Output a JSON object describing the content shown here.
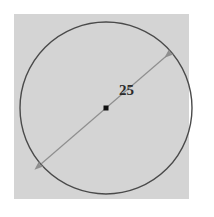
{
  "figure": {
    "kind": "geometry-diagram",
    "panel": {
      "background_color": "#d4d4d4",
      "x": 14,
      "y": 14,
      "width": 175,
      "height": 185
    },
    "circle": {
      "center_x": 106,
      "center_y": 108,
      "radius": 86,
      "stroke_color": "#4a4a4a",
      "fill_color": "none"
    },
    "center_point": {
      "name": "center-marker",
      "x": 106,
      "y": 108,
      "size": 5,
      "color": "#111111"
    },
    "diameter_arrow": {
      "name": "diameter-double-arrow",
      "x1": 41,
      "y1": 164,
      "x2": 171,
      "y2": 52,
      "stroke_color": "#8f8f8f",
      "arrowheads": "both"
    },
    "measurement_label": {
      "text": "25",
      "x": 119,
      "y": 83,
      "color": "#2b2b2b"
    },
    "ghost_text": "    .      .. .    .    .  .      ...  .  ."
  },
  "chart_data": {
    "type": "diagram",
    "title": "",
    "shape": "circle",
    "annotations": [
      {
        "label": "25",
        "measures": "diameter",
        "value": 25,
        "units": ""
      }
    ],
    "elements": [
      {
        "name": "circle-outline",
        "type": "circle",
        "cx": 106,
        "cy": 108,
        "r": 86
      },
      {
        "name": "center-marker",
        "type": "point",
        "x": 106,
        "y": 108
      },
      {
        "name": "diameter-segment",
        "type": "double-arrow",
        "from": [
          41,
          164
        ],
        "to": [
          171,
          52
        ],
        "label": "25"
      }
    ],
    "xlabel": "",
    "ylabel": "",
    "legend": []
  }
}
